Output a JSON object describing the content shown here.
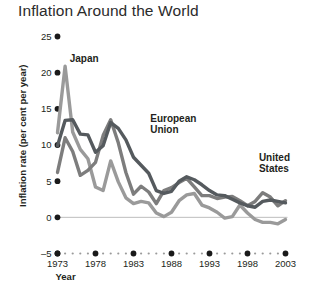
{
  "chart": {
    "title": "Inflation Around the World"
  },
  "chart_data": {
    "type": "line",
    "title": "Inflation Around the World",
    "xlabel": "Year",
    "ylabel": "Inflation rate (per cent per year)",
    "xlim": [
      1973,
      2003
    ],
    "ylim": [
      -5,
      25
    ],
    "yticks": [
      25,
      20,
      15,
      10,
      5,
      0,
      -5
    ],
    "ytick_labels": [
      "25",
      "20",
      "15",
      "10",
      "5",
      "0",
      "–5"
    ],
    "xticks": [
      1973,
      1978,
      1983,
      1988,
      1993,
      1998,
      2003
    ],
    "xtick_labels": [
      "1973",
      "1978",
      "1983",
      "1988",
      "1993",
      "1998",
      "2003"
    ],
    "grid": false,
    "legend": "inline-annotations",
    "x": [
      1973,
      1974,
      1975,
      1976,
      1977,
      1978,
      1979,
      1980,
      1981,
      1982,
      1983,
      1984,
      1985,
      1986,
      1987,
      1988,
      1989,
      1990,
      1991,
      1992,
      1993,
      1994,
      1995,
      1996,
      1997,
      1998,
      1999,
      2000,
      2001,
      2002,
      2003
    ],
    "series": [
      {
        "name": "Japan",
        "color": "#9a9a9a",
        "label_x": 1974.6,
        "label_y": 21.5,
        "values": [
          11.7,
          20.9,
          11.8,
          9.4,
          8.1,
          4.2,
          3.7,
          7.8,
          4.9,
          2.7,
          1.9,
          2.2,
          2.0,
          0.6,
          0.1,
          0.7,
          2.3,
          3.1,
          3.3,
          1.7,
          1.3,
          0.7,
          -0.1,
          0.1,
          1.7,
          0.6,
          -0.3,
          -0.7,
          -0.7,
          -0.9,
          -0.3
        ]
      },
      {
        "name": "European Union",
        "color": "#555a5e",
        "label_x": 1985.2,
        "label_y": 13.2,
        "values": [
          9.9,
          13.4,
          13.5,
          11.5,
          11.4,
          9.0,
          9.9,
          13.1,
          12.3,
          10.7,
          8.3,
          7.2,
          6.1,
          3.7,
          3.3,
          3.6,
          5.0,
          5.6,
          5.2,
          4.5,
          3.7,
          3.1,
          3.0,
          2.5,
          2.0,
          1.6,
          1.4,
          2.2,
          2.4,
          2.2,
          2.0
        ]
      },
      {
        "name": "United States",
        "color": "#7d7d7d",
        "label_x": 1999.5,
        "label_y": 7.8,
        "values": [
          6.2,
          11.0,
          9.1,
          5.8,
          6.5,
          7.6,
          11.3,
          13.5,
          10.3,
          6.2,
          3.2,
          4.3,
          3.5,
          1.9,
          3.7,
          4.1,
          4.8,
          5.4,
          4.2,
          3.0,
          3.0,
          2.6,
          2.8,
          2.9,
          2.3,
          1.6,
          2.2,
          3.4,
          2.8,
          1.6,
          2.3
        ]
      }
    ]
  }
}
